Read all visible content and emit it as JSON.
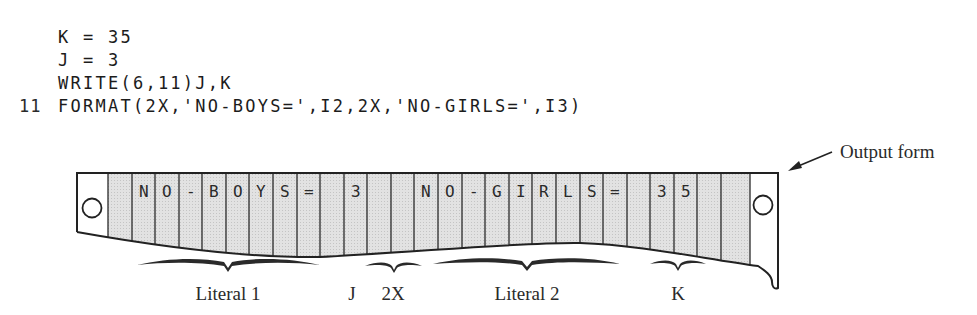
{
  "code": {
    "lines": [
      {
        "label": "",
        "text": "K = 35"
      },
      {
        "label": "",
        "text": "J = 3"
      },
      {
        "label": "",
        "text": "WRITE(6,11)J,K"
      },
      {
        "label": "11",
        "text": "FORMAT(2X,'NO-BOYS=',I2,2X,'NO-GIRLS=',I3)"
      }
    ]
  },
  "output_form": {
    "callout_label": "Output form",
    "cells": [
      "",
      "N",
      "O",
      "-",
      "B",
      "O",
      "Y",
      "S",
      "=",
      "",
      "3",
      "",
      "",
      "N",
      "O",
      "-",
      "G",
      "I",
      "R",
      "L",
      "S",
      "=",
      "",
      "3",
      "5",
      "",
      ""
    ],
    "colors": {
      "cell_fill": "#dcdcdc",
      "margin_fill": "#ffffff",
      "line": "#222222"
    }
  },
  "annotations": [
    {
      "label": "Literal 1",
      "x": 228
    },
    {
      "label": "J",
      "x": 352
    },
    {
      "label": "2X",
      "x": 393
    },
    {
      "label": "Literal 2",
      "x": 527
    },
    {
      "label": "K",
      "x": 678
    }
  ]
}
